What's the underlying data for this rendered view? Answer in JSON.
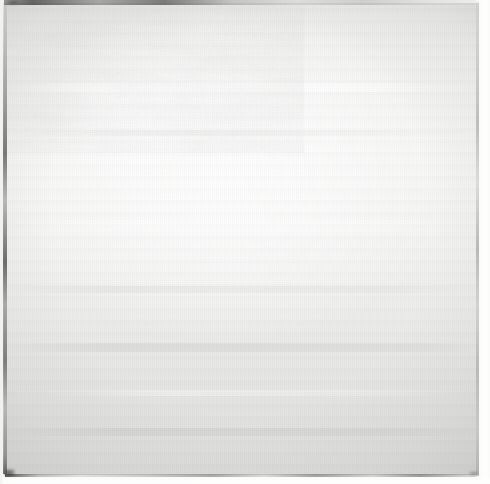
{
  "artwork": {
    "kind": "monochrome-painting",
    "title": "Untitled (White Painting)",
    "surface": "painted canvas, square format",
    "palette": {
      "canvas_lightest": "#fdfdfd",
      "canvas_light": "#f7f7f6",
      "canvas_mid": "#eeeeec",
      "canvas_grey": "#e3e3e2",
      "canvas_shadow": "#dedede",
      "edge_dark": "#3a3a38",
      "edge_mid": "#6e6e6c",
      "margin_white": "#fbfbfa",
      "paper_ground": "#f4f4f2"
    },
    "composition": {
      "field": "near-uniform off-white field filling the frame",
      "luminous_center": "soft bloom of brighter white slightly above and left of centre",
      "lower_third": "cooler, greyer tone with visible horizontal banding",
      "texture": "fine canvas weave plus broad horizontal brush sweeps"
    },
    "edges": [
      {
        "name": "top-edge-line",
        "position": "top",
        "tone": "dark, strongest across the left half, fading right"
      },
      {
        "name": "left-edge-line",
        "position": "left",
        "tone": "thin irregular dark vertical line, broken in places"
      },
      {
        "name": "bottom-edge-line",
        "position": "bottom",
        "tone": "thin dark line with a pale strip beneath it"
      },
      {
        "name": "right-edge-line",
        "position": "right",
        "tone": "faint grey vertical line, lighter margin outside"
      }
    ],
    "accents": [
      {
        "name": "bottom-left-blot",
        "tone": "small dark smudge at the lower-left corner"
      },
      {
        "name": "top-left-blot",
        "tone": "dark patch along the upper-left edge"
      },
      {
        "name": "bottom-right-blot",
        "tone": "faint dark mark near the lower-right corner"
      }
    ],
    "brush_strokes": [
      {
        "name": "stroke-upper-light",
        "band": "upper field",
        "tone": "light"
      },
      {
        "name": "stroke-upper-grey",
        "band": "upper field",
        "tone": "grey"
      },
      {
        "name": "stroke-middle-light",
        "band": "middle field",
        "tone": "light"
      },
      {
        "name": "stroke-middle-grey",
        "band": "middle field",
        "tone": "grey"
      },
      {
        "name": "stroke-lower-grey",
        "band": "lower field",
        "tone": "grey"
      },
      {
        "name": "stroke-lower-light",
        "band": "lower field",
        "tone": "light"
      },
      {
        "name": "stroke-base-grey",
        "band": "base field",
        "tone": "grey"
      }
    ]
  }
}
